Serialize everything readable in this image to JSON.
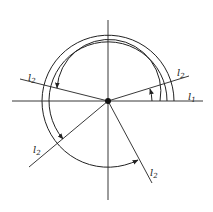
{
  "diagram": {
    "title": "",
    "center": {
      "x": 108,
      "y": 101
    },
    "colors": {
      "stroke": "#222222",
      "background": "#ffffff"
    },
    "labels": [
      {
        "id": "l1-label",
        "base": "l",
        "sub": "1",
        "x": 188,
        "y": 100
      },
      {
        "id": "l2-upper-right-label",
        "base": "l",
        "sub": "2",
        "x": 179,
        "y": 78
      },
      {
        "id": "l2-upper-left-label",
        "base": "l",
        "sub": "2",
        "x": 28,
        "y": 82
      },
      {
        "id": "l2-lower-left-label",
        "base": "l",
        "sub": "2",
        "x": 32,
        "y": 155
      },
      {
        "id": "l2-lower-right-label",
        "base": "l",
        "sub": "2",
        "x": 150,
        "y": 177
      }
    ]
  }
}
